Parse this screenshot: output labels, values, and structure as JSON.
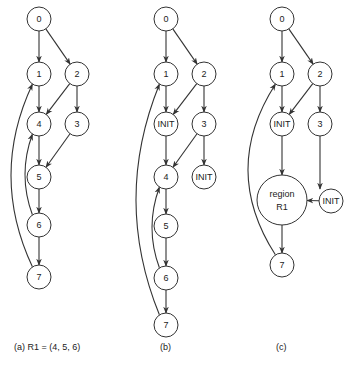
{
  "figure": {
    "panels": [
      {
        "id": "a",
        "caption": "(a)   R1 = (4, 5, 6)",
        "caption_pos": [
          14,
          350
        ],
        "radius": 12,
        "nodes": [
          {
            "id": "a0",
            "label": "0",
            "x": 39,
            "y": 19
          },
          {
            "id": "a1",
            "label": "1",
            "x": 39,
            "y": 74
          },
          {
            "id": "a2",
            "label": "2",
            "x": 77,
            "y": 74
          },
          {
            "id": "a4",
            "label": "4",
            "x": 39,
            "y": 124
          },
          {
            "id": "a3",
            "label": "3",
            "x": 77,
            "y": 124
          },
          {
            "id": "a5",
            "label": "5",
            "x": 39,
            "y": 177
          },
          {
            "id": "a6",
            "label": "6",
            "x": 39,
            "y": 225
          },
          {
            "id": "a7",
            "label": "7",
            "x": 39,
            "y": 277
          }
        ],
        "edges": [
          {
            "from": "a0",
            "to": "a1"
          },
          {
            "from": "a0",
            "to": "a2"
          },
          {
            "from": "a1",
            "to": "a4"
          },
          {
            "from": "a2",
            "to": "a4"
          },
          {
            "from": "a2",
            "to": "a3"
          },
          {
            "from": "a4",
            "to": "a5"
          },
          {
            "from": "a3",
            "to": "a5"
          },
          {
            "from": "a5",
            "to": "a6"
          },
          {
            "from": "a6",
            "to": "a7"
          },
          {
            "from": "a6",
            "to": "a4",
            "curve": -14
          },
          {
            "from": "a7",
            "to": "a1",
            "curve": -28
          }
        ]
      },
      {
        "id": "b",
        "caption": "(b)",
        "caption_pos": [
          160,
          350
        ],
        "radius": 12,
        "nodes": [
          {
            "id": "b0",
            "label": "0",
            "x": 166,
            "y": 19
          },
          {
            "id": "b1",
            "label": "1",
            "x": 166,
            "y": 74
          },
          {
            "id": "b2",
            "label": "2",
            "x": 204,
            "y": 74
          },
          {
            "id": "bI1",
            "label": "INIT",
            "x": 166,
            "y": 124
          },
          {
            "id": "b3",
            "label": "3",
            "x": 204,
            "y": 124
          },
          {
            "id": "b4",
            "label": "4",
            "x": 166,
            "y": 177
          },
          {
            "id": "bI2",
            "label": "INIT",
            "x": 204,
            "y": 177
          },
          {
            "id": "b5",
            "label": "5",
            "x": 166,
            "y": 226
          },
          {
            "id": "b6",
            "label": "6",
            "x": 166,
            "y": 278
          },
          {
            "id": "b7",
            "label": "7",
            "x": 166,
            "y": 325
          }
        ],
        "edges": [
          {
            "from": "b0",
            "to": "b1"
          },
          {
            "from": "b0",
            "to": "b2"
          },
          {
            "from": "b1",
            "to": "bI1"
          },
          {
            "from": "b2",
            "to": "bI1"
          },
          {
            "from": "b2",
            "to": "b3"
          },
          {
            "from": "bI1",
            "to": "b4"
          },
          {
            "from": "b3",
            "to": "b4"
          },
          {
            "from": "b3",
            "to": "bI2"
          },
          {
            "from": "b4",
            "to": "b5"
          },
          {
            "from": "b5",
            "to": "b6"
          },
          {
            "from": "b6",
            "to": "b7"
          },
          {
            "from": "b6",
            "to": "b4",
            "curve": -14
          },
          {
            "from": "b7",
            "to": "b1",
            "curve": -30
          }
        ]
      },
      {
        "id": "c",
        "caption": "(c)",
        "caption_pos": [
          276,
          350
        ],
        "radius": 12,
        "nodes": [
          {
            "id": "c0",
            "label": "0",
            "x": 282,
            "y": 19
          },
          {
            "id": "c1",
            "label": "1",
            "x": 282,
            "y": 74
          },
          {
            "id": "c2",
            "label": "2",
            "x": 320,
            "y": 74
          },
          {
            "id": "cI1",
            "label": "INIT",
            "x": 282,
            "y": 124
          },
          {
            "id": "c3",
            "label": "3",
            "x": 320,
            "y": 124
          },
          {
            "id": "cR",
            "label": "region",
            "label2": "R1",
            "x": 282,
            "y": 200,
            "r": 25
          },
          {
            "id": "cI2",
            "label": "INIT",
            "x": 331,
            "y": 201
          },
          {
            "id": "c7",
            "label": "7",
            "x": 282,
            "y": 265
          }
        ],
        "edges": [
          {
            "from": "c0",
            "to": "c1"
          },
          {
            "from": "c0",
            "to": "c2"
          },
          {
            "from": "c1",
            "to": "cI1"
          },
          {
            "from": "c2",
            "to": "cI1"
          },
          {
            "from": "c2",
            "to": "c3"
          },
          {
            "from": "cI1",
            "to": "cR"
          },
          {
            "from": "c3",
            "to": "cI2",
            "vertical": true
          },
          {
            "from": "cI2",
            "to": "cR"
          },
          {
            "from": "cR",
            "to": "c7"
          },
          {
            "from": "c7",
            "to": "c1",
            "curve": -34
          }
        ]
      }
    ]
  }
}
